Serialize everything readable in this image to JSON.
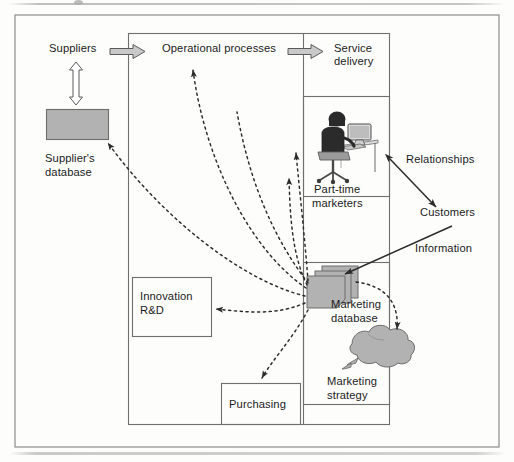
{
  "figure": {
    "title": "",
    "outer_frame": {
      "x": 14,
      "y": 14,
      "w": 486,
      "h": 434
    },
    "colors": {
      "line": "#4a4a4a",
      "shape_fill": "#b2b2b2",
      "shape_stroke": "#6d6d6d",
      "arrow_fill": "#c9c9c9",
      "text": "#1b1b1b",
      "page": "#fdfdfc"
    }
  },
  "labels": {
    "suppliers": "Suppliers",
    "operational_processes": "Operational processes",
    "service_delivery_line1": "Service",
    "service_delivery_line2": "delivery",
    "suppliers_database_line1": "Supplier's",
    "suppliers_database_line2": "database",
    "part_time_line1": "Part-time",
    "part_time_line2": "marketers",
    "relationships": "Relationships",
    "customers": "Customers",
    "information": "Information",
    "innovation_line1": "Innovation",
    "innovation_line2": "R&D",
    "marketing_database_line1": "Marketing",
    "marketing_database_line2": "database",
    "marketing_strategy_line1": "Marketing",
    "marketing_strategy_line2": "strategy",
    "purchasing": "Purchasing"
  },
  "nodes": [
    {
      "name": "suppliers-label",
      "text": "Suppliers",
      "type": "text"
    },
    {
      "name": "suppliers-database",
      "text": "Supplier's database",
      "type": "cylinder-block"
    },
    {
      "name": "operational-processes",
      "text": "Operational processes",
      "type": "text"
    },
    {
      "name": "service-delivery",
      "text": "Service delivery",
      "type": "text"
    },
    {
      "name": "part-time-marketers",
      "text": "Part-time marketers",
      "type": "box-with-icon"
    },
    {
      "name": "marketing-database",
      "text": "Marketing database",
      "type": "stacked-db"
    },
    {
      "name": "marketing-strategy",
      "text": "Marketing strategy",
      "type": "cloud"
    },
    {
      "name": "innovation-rd",
      "text": "Innovation R&D",
      "type": "box"
    },
    {
      "name": "purchasing",
      "text": "Purchasing",
      "type": "box"
    },
    {
      "name": "relationships",
      "text": "Relationships",
      "type": "text"
    },
    {
      "name": "customers",
      "text": "Customers",
      "type": "text"
    },
    {
      "name": "information",
      "text": "Information",
      "type": "text"
    }
  ],
  "connectors": [
    {
      "name": "suppliers-to-operational",
      "style": "block-arrow",
      "direction": "right"
    },
    {
      "name": "operational-to-service",
      "style": "block-arrow",
      "direction": "right"
    },
    {
      "name": "suppliers-to-database",
      "style": "block-arrow",
      "direction": "both-vertical"
    },
    {
      "name": "marketing-db-to-suppliers-db",
      "style": "dashed-arrow"
    },
    {
      "name": "marketing-db-to-operational",
      "style": "dashed-arrow"
    },
    {
      "name": "marketing-db-to-part-time",
      "style": "dashed-arrow"
    },
    {
      "name": "marketing-db-to-innovation",
      "style": "dashed-arrow"
    },
    {
      "name": "marketing-db-to-purchasing",
      "style": "dashed-arrow"
    },
    {
      "name": "marketing-db-to-strategy",
      "style": "dashed-arrow"
    },
    {
      "name": "relationships-customers",
      "style": "solid-double-arrow"
    },
    {
      "name": "information-to-marketing-db",
      "style": "solid-arrow"
    }
  ]
}
